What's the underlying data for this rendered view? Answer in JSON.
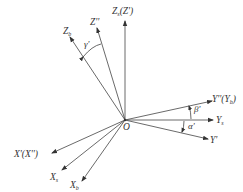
{
  "diagram": {
    "type": "coordinate-frame-rotation",
    "origin": {
      "label": "O",
      "x": 125,
      "y": 120
    },
    "line_color": "#444444",
    "axes": [
      {
        "id": "zs",
        "label": "Zs(Z')",
        "tip": [
          125,
          20
        ]
      },
      {
        "id": "z2",
        "label": "Z''",
        "tip": [
          97,
          27
        ]
      },
      {
        "id": "zb",
        "label": "Zb",
        "tip": [
          69,
          36
        ]
      },
      {
        "id": "y2",
        "label": "Y''(Yb)",
        "tip": [
          213,
          101
        ]
      },
      {
        "id": "ys",
        "label": "Ys",
        "tip": [
          214,
          120
        ]
      },
      {
        "id": "y1",
        "label": "Y'",
        "tip": [
          209,
          139
        ]
      },
      {
        "id": "x1",
        "label": "X'(X'')",
        "tip": [
          51,
          153
        ]
      },
      {
        "id": "xs",
        "label": "Xs",
        "tip": [
          61,
          171
        ]
      },
      {
        "id": "xb",
        "label": "Xb",
        "tip": [
          82,
          182
        ]
      }
    ],
    "angles": [
      {
        "id": "gamma",
        "label": "γ'",
        "between": [
          "Zb",
          "Z''"
        ]
      },
      {
        "id": "beta",
        "label": "β'",
        "between": [
          "Ys",
          "Y''(Yb)"
        ]
      },
      {
        "id": "alpha",
        "label": "α'",
        "between": [
          "Ys",
          "Y'"
        ]
      }
    ]
  }
}
